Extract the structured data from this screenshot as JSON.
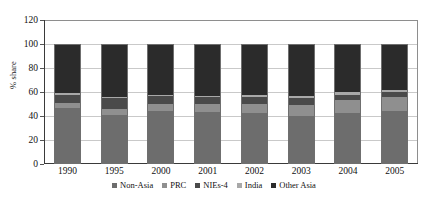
{
  "chart_data": {
    "type": "bar",
    "subtype": "stacked-column",
    "title": "",
    "xlabel": "",
    "ylabel": "% share",
    "ylim": [
      0,
      120
    ],
    "ytick_step": 20,
    "yticks": [
      "0",
      "20",
      "40",
      "60",
      "80",
      "100",
      "120"
    ],
    "grid": true,
    "grid_axis": "y",
    "legend_position": "bottom",
    "categories": [
      "1990",
      "1995",
      "2000",
      "2001",
      "2002",
      "2003",
      "2004",
      "2005"
    ],
    "series": [
      {
        "name": "Non-Asia",
        "color": "#6d6d6d",
        "values": [
          47,
          41,
          44,
          43,
          42,
          40,
          42,
          44
        ]
      },
      {
        "name": "PRC",
        "color": "#8f8f8f",
        "values": [
          4,
          5,
          6,
          7,
          8,
          9,
          11,
          12
        ]
      },
      {
        "name": "NIEs-4",
        "color": "#4a4a4a",
        "values": [
          7,
          9,
          7,
          6,
          6,
          6,
          5,
          4
        ]
      },
      {
        "name": "India",
        "color": "#a8a8a8",
        "values": [
          1,
          1,
          1,
          1,
          2,
          2,
          2,
          2
        ]
      },
      {
        "name": "Other Asia",
        "color": "#2b2b2b",
        "values": [
          41,
          44,
          42,
          43,
          42,
          43,
          40,
          38
        ]
      }
    ]
  },
  "axis": {
    "y_title": "% share"
  }
}
